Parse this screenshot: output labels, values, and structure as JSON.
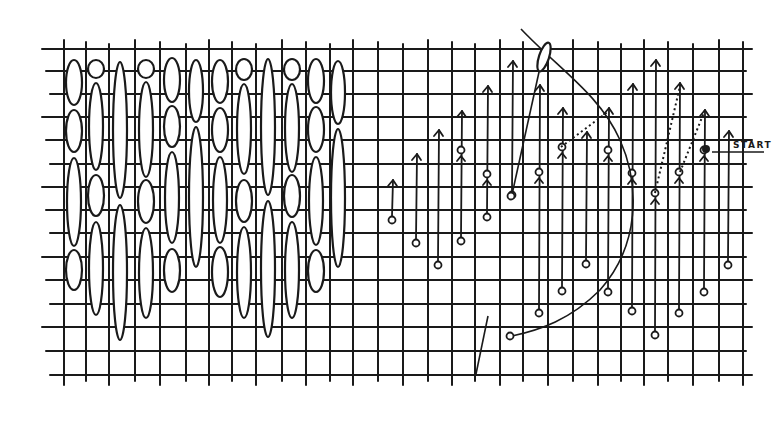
{
  "diagram": {
    "title": "",
    "start_label": "START",
    "colors": {
      "ink": "#1a1a1a",
      "paper": "#ffffff"
    },
    "grid": {
      "rows_y": [
        49,
        71,
        94,
        117,
        140,
        164,
        187,
        210,
        233,
        257,
        280,
        304,
        327,
        351,
        375
      ],
      "cols_x": [
        64,
        86,
        109,
        135,
        160,
        186,
        209,
        232,
        256,
        282,
        306,
        330,
        353,
        378,
        403,
        428,
        452,
        475,
        500,
        523,
        548,
        573,
        598,
        621,
        644,
        668,
        693,
        719,
        743
      ],
      "x_start": 42,
      "x_end": 752,
      "y_top": 40,
      "y_bottom": 385
    },
    "left_panel": {
      "description": "completed upright stitches (ovals) over grid",
      "columns": [
        {
          "x": 74,
          "stitches": [
            [
              60,
              105
            ],
            [
              110,
              152
            ],
            [
              158,
              246
            ],
            [
              250,
              290
            ]
          ]
        },
        {
          "x": 96,
          "stitches": [
            [
              60,
              78
            ],
            [
              83,
              170
            ],
            [
              175,
              216
            ],
            [
              222,
              315
            ]
          ]
        },
        {
          "x": 120,
          "stitches": [
            [
              62,
              198
            ],
            [
              205,
              340
            ]
          ]
        },
        {
          "x": 146,
          "stitches": [
            [
              60,
              78
            ],
            [
              82,
              177
            ],
            [
              180,
              223
            ],
            [
              228,
              318
            ]
          ]
        },
        {
          "x": 172,
          "stitches": [
            [
              58,
              102
            ],
            [
              106,
              147
            ],
            [
              152,
              243
            ],
            [
              249,
              292
            ]
          ]
        },
        {
          "x": 196,
          "stitches": [
            [
              60,
              122
            ],
            [
              127,
              267
            ]
          ]
        },
        {
          "x": 220,
          "stitches": [
            [
              60,
              103
            ],
            [
              108,
              152
            ],
            [
              157,
              243
            ],
            [
              247,
              297
            ]
          ]
        },
        {
          "x": 244,
          "stitches": [
            [
              59,
              80
            ],
            [
              84,
              174
            ],
            [
              180,
              222
            ],
            [
              227,
              318
            ]
          ]
        },
        {
          "x": 268,
          "stitches": [
            [
              59,
              195
            ],
            [
              201,
              337
            ]
          ]
        },
        {
          "x": 292,
          "stitches": [
            [
              59,
              80
            ],
            [
              84,
              172
            ],
            [
              175,
              217
            ],
            [
              222,
              318
            ]
          ]
        },
        {
          "x": 316,
          "stitches": [
            [
              59,
              103
            ],
            [
              107,
              152
            ],
            [
              157,
              245
            ],
            [
              250,
              292
            ]
          ]
        },
        {
          "x": 338,
          "stitches": [
            [
              61,
              124
            ],
            [
              129,
              267
            ]
          ]
        }
      ]
    },
    "right_panel": {
      "description": "working diagram with needle path, thread and stitch arrows",
      "stitches": [
        {
          "x": 392,
          "from": 220,
          "to": 180,
          "hole_top": false
        },
        {
          "x": 416,
          "from": 243,
          "to": 154,
          "hole_top": false
        },
        {
          "x": 438,
          "from": 265,
          "to": 130,
          "hole_top": false
        },
        {
          "x": 461,
          "from": 241,
          "to": 111,
          "hole_top": 150
        },
        {
          "x": 487,
          "from": 217,
          "to": 86,
          "hole_top": 174
        },
        {
          "x": 512,
          "from": 195,
          "to": 61,
          "hole_top": false
        },
        {
          "x": 539,
          "from": 313,
          "to": 85,
          "hole_top": 172
        },
        {
          "x": 562,
          "from": 291,
          "to": 108,
          "hole_top": 147
        },
        {
          "x": 586,
          "from": 264,
          "to": 132,
          "hole_top": false
        },
        {
          "x": 608,
          "from": 292,
          "to": 108,
          "hole_top": 150
        },
        {
          "x": 632,
          "from": 311,
          "to": 84,
          "hole_top": 173
        },
        {
          "x": 655,
          "from": 335,
          "to": 60,
          "hole_top": 193
        },
        {
          "x": 679,
          "from": 313,
          "to": 83,
          "hole_top": 172
        },
        {
          "x": 704,
          "from": 292,
          "to": 110,
          "hole_top": 150
        },
        {
          "x": 728,
          "from": 265,
          "to": 131,
          "hole_top": false
        }
      ],
      "start_point": {
        "x": 706,
        "y": 149
      }
    }
  }
}
